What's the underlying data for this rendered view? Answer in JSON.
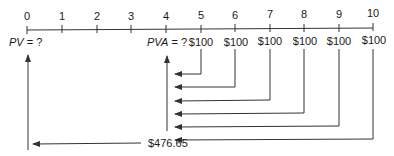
{
  "timeline": {
    "periods": [
      "0",
      "1",
      "2",
      "3",
      "4",
      "5",
      "6",
      "7",
      "8",
      "9",
      "10"
    ],
    "tick_x": [
      27,
      62,
      97,
      131,
      166,
      201,
      235,
      270,
      304,
      339,
      373
    ]
  },
  "labels": {
    "pv_var": "PV",
    "pv_rest": " = ?",
    "pva_var": "PVA",
    "pva_rest": " = ?",
    "total": "$476.65"
  },
  "payments": [
    {
      "period": "5",
      "amount": "$100"
    },
    {
      "period": "6",
      "amount": "$100"
    },
    {
      "period": "7",
      "amount": "$100"
    },
    {
      "period": "8",
      "amount": "$100"
    },
    {
      "period": "9",
      "amount": "$100"
    },
    {
      "period": "10",
      "amount": "$100"
    }
  ],
  "colors": {
    "line": "#333333",
    "text": "#1a1a1a"
  }
}
